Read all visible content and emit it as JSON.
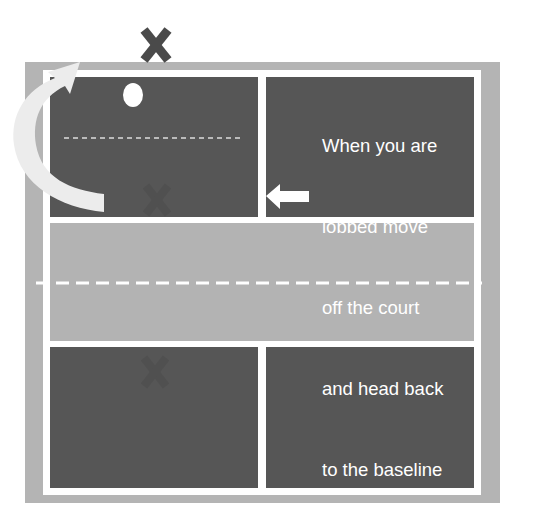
{
  "diagram": {
    "note_lines": [
      "When you are",
      "lobbed move",
      "off the court",
      "and head back",
      "to the baseline"
    ],
    "markers": {
      "player_top_label": "X",
      "partner_label": "X",
      "opponent_label": "X"
    },
    "colors": {
      "court_surround": "#b4b4b4",
      "service_box": "#565656",
      "kitchen": "#b3b3b3",
      "lines": "#ffffff",
      "player_x": "#4a4a4a"
    }
  }
}
